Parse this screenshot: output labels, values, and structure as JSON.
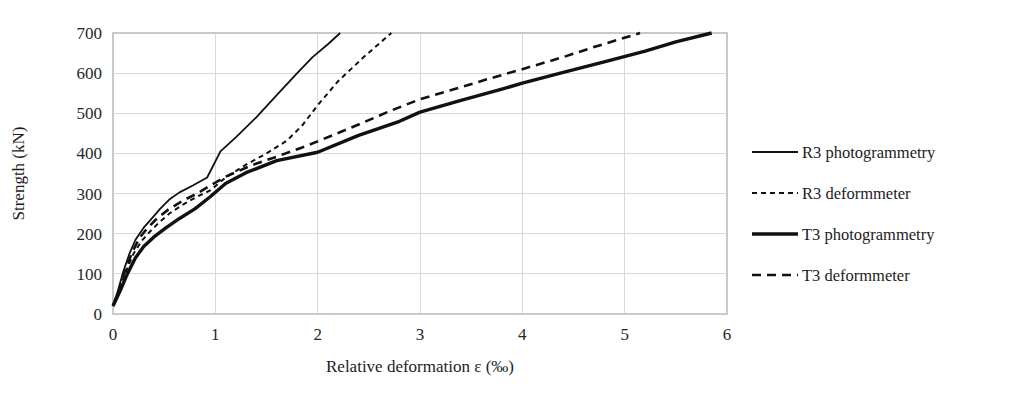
{
  "chart_data": {
    "type": "line",
    "title": "",
    "xlabel": "Relative deformation ε (‰)",
    "ylabel": "Strength (kN)",
    "xlim": [
      0,
      6
    ],
    "ylim": [
      0,
      700
    ],
    "xticks": [
      0,
      1,
      2,
      3,
      4,
      5,
      6
    ],
    "yticks": [
      0,
      100,
      200,
      300,
      400,
      500,
      600,
      700
    ],
    "xtick_labels": [
      "0",
      "1",
      "2",
      "3",
      "4",
      "5",
      "6"
    ],
    "ytick_labels": [
      "0",
      "100",
      "200",
      "300",
      "400",
      "500",
      "600",
      "700"
    ],
    "grid": "horizontal-and-vertical",
    "legend_position": "right",
    "series": [
      {
        "name": "R3 photogrammetry",
        "style": "solid-thin",
        "stroke_width": 1.8,
        "dash": "none",
        "points": [
          [
            0.0,
            20
          ],
          [
            0.05,
            60
          ],
          [
            0.1,
            105
          ],
          [
            0.16,
            150
          ],
          [
            0.22,
            185
          ],
          [
            0.3,
            215
          ],
          [
            0.38,
            238
          ],
          [
            0.46,
            262
          ],
          [
            0.55,
            285
          ],
          [
            0.65,
            303
          ],
          [
            0.78,
            320
          ],
          [
            0.92,
            340
          ],
          [
            1.05,
            405
          ],
          [
            1.2,
            440
          ],
          [
            1.4,
            490
          ],
          [
            1.6,
            545
          ],
          [
            1.8,
            600
          ],
          [
            1.95,
            640
          ],
          [
            2.1,
            672
          ],
          [
            2.22,
            700
          ]
        ]
      },
      {
        "name": "R3 deformmeter",
        "style": "dashed-fine",
        "stroke_width": 2.0,
        "dash": "5,4",
        "points": [
          [
            0.0,
            20
          ],
          [
            0.06,
            60
          ],
          [
            0.13,
            108
          ],
          [
            0.2,
            150
          ],
          [
            0.28,
            182
          ],
          [
            0.36,
            205
          ],
          [
            0.45,
            228
          ],
          [
            0.56,
            252
          ],
          [
            0.68,
            272
          ],
          [
            0.82,
            292
          ],
          [
            0.95,
            308
          ],
          [
            1.1,
            340
          ],
          [
            1.3,
            372
          ],
          [
            1.5,
            400
          ],
          [
            1.7,
            432
          ],
          [
            1.85,
            470
          ],
          [
            2.0,
            520
          ],
          [
            2.2,
            580
          ],
          [
            2.45,
            640
          ],
          [
            2.72,
            700
          ]
        ]
      },
      {
        "name": "T3 photogrammetry",
        "style": "solid-thick",
        "stroke_width": 3.4,
        "dash": "none",
        "points": [
          [
            0.0,
            20
          ],
          [
            0.07,
            58
          ],
          [
            0.14,
            100
          ],
          [
            0.22,
            140
          ],
          [
            0.3,
            168
          ],
          [
            0.4,
            192
          ],
          [
            0.52,
            215
          ],
          [
            0.65,
            238
          ],
          [
            0.8,
            262
          ],
          [
            0.95,
            292
          ],
          [
            1.1,
            325
          ],
          [
            1.3,
            352
          ],
          [
            1.6,
            382
          ],
          [
            2.0,
            403
          ],
          [
            2.4,
            445
          ],
          [
            2.8,
            480
          ],
          [
            3.0,
            503
          ],
          [
            3.4,
            532
          ],
          [
            3.8,
            560
          ],
          [
            4.0,
            575
          ],
          [
            4.4,
            602
          ],
          [
            4.8,
            628
          ],
          [
            5.2,
            655
          ],
          [
            5.5,
            678
          ],
          [
            5.85,
            700
          ]
        ]
      },
      {
        "name": "T3 deformmeter",
        "style": "dashed-long",
        "stroke_width": 2.6,
        "dash": "9,6",
        "points": [
          [
            0.0,
            20
          ],
          [
            0.06,
            62
          ],
          [
            0.12,
            110
          ],
          [
            0.19,
            155
          ],
          [
            0.26,
            190
          ],
          [
            0.34,
            215
          ],
          [
            0.43,
            238
          ],
          [
            0.54,
            260
          ],
          [
            0.68,
            282
          ],
          [
            0.82,
            300
          ],
          [
            0.95,
            320
          ],
          [
            1.1,
            342
          ],
          [
            1.35,
            370
          ],
          [
            1.6,
            392
          ],
          [
            1.85,
            415
          ],
          [
            2.0,
            430
          ],
          [
            2.4,
            472
          ],
          [
            2.7,
            505
          ],
          [
            3.0,
            535
          ],
          [
            3.4,
            565
          ],
          [
            3.7,
            588
          ],
          [
            4.0,
            610
          ],
          [
            4.4,
            640
          ],
          [
            4.7,
            665
          ],
          [
            5.15,
            700
          ]
        ]
      }
    ],
    "legend_entries": [
      {
        "label": "R3 photogrammetry",
        "style": "solid-thin"
      },
      {
        "label": "R3 deformmeter",
        "style": "dashed-fine"
      },
      {
        "label": "T3 photogrammetry",
        "style": "solid-thick"
      },
      {
        "label": "T3 deformmeter",
        "style": "dashed-long"
      }
    ],
    "colors": {
      "series_stroke": "#111111",
      "grid": "#d8d8d8",
      "frame": "#c9c9c9",
      "text": "#1c1c1c",
      "background": "#ffffff"
    }
  }
}
